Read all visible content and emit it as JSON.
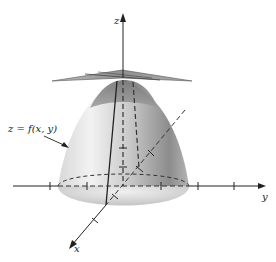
{
  "figure": {
    "type": "3d-surface-diagram"
  },
  "labels": {
    "z_axis": "z",
    "y_axis": "y",
    "x_axis": "x",
    "surface": "z = f(x, y)"
  },
  "colors": {
    "axis": "#222222",
    "surface_light": "#e6e6e6",
    "surface_dark": "#8a8a8a",
    "plane": "#9a9a9a",
    "background": "#ffffff"
  },
  "axes": {
    "y_ticks": 7,
    "x_ticks": 4,
    "z_ticks": 2
  }
}
